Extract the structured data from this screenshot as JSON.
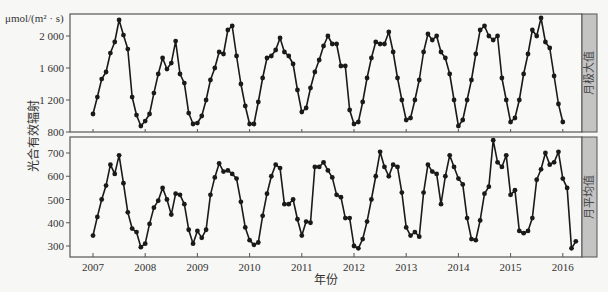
{
  "chart_data": [
    {
      "type": "line",
      "panel": "top",
      "strip_label": "月极大值",
      "unit_label": "μmol/(m² · s)",
      "ylabel": "光合有效辐射",
      "xlabel": "年份",
      "x_start": "2007-01",
      "x_step": "month",
      "x_ticks": [
        "2007",
        "2008",
        "2009",
        "2010",
        "2011",
        "2012",
        "2013",
        "2014",
        "2015",
        "2016"
      ],
      "y_ticks": [
        800,
        1200,
        1600,
        2000
      ],
      "y_tick_labels": [
        "800",
        "1 200",
        "1 600",
        "2 000"
      ],
      "ylim": [
        780,
        2250
      ],
      "values": [
        1025,
        1237,
        1462,
        1550,
        1787,
        1925,
        2200,
        2012,
        1837,
        1237,
        1012,
        875,
        937,
        1025,
        1287,
        1525,
        1725,
        1587,
        1662,
        1937,
        1525,
        1412,
        1037,
        900,
        912,
        1000,
        1200,
        1450,
        1600,
        1800,
        1775,
        2075,
        2125,
        1750,
        1400,
        1125,
        900,
        900,
        1175,
        1475,
        1725,
        1750,
        1825,
        1975,
        1800,
        1750,
        1650,
        1325,
        1050,
        1100,
        1350,
        1550,
        1700,
        1875,
        2000,
        1900,
        1900,
        1625,
        1625,
        1075,
        900,
        925,
        1175,
        1475,
        1725,
        1925,
        1900,
        1900,
        2050,
        1800,
        1475,
        1200,
        950,
        975,
        1200,
        1450,
        1800,
        2025,
        1950,
        2000,
        1800,
        1725,
        1525,
        1200,
        875,
        950,
        1200,
        1450,
        1775,
        2075,
        2125,
        2000,
        1950,
        2000,
        1475,
        1200,
        925,
        975,
        1200,
        1525,
        1775,
        2075,
        2000,
        2225,
        1925,
        1850,
        1500,
        1150,
        925
      ]
    },
    {
      "type": "line",
      "panel": "bottom",
      "strip_label": "月平均值",
      "ylabel": "光合有效辐射",
      "xlabel": "年份",
      "x_start": "2007-01",
      "x_step": "month",
      "x_ticks": [
        "2007",
        "2008",
        "2009",
        "2010",
        "2011",
        "2012",
        "2013",
        "2014",
        "2015",
        "2016"
      ],
      "y_ticks": [
        300,
        400,
        500,
        600,
        700
      ],
      "y_tick_labels": [
        "300",
        "400",
        "500",
        "600",
        "700"
      ],
      "ylim": [
        255,
        770
      ],
      "values": [
        345,
        425,
        500,
        560,
        650,
        610,
        690,
        570,
        445,
        375,
        360,
        295,
        310,
        395,
        465,
        495,
        550,
        500,
        435,
        525,
        520,
        480,
        370,
        310,
        365,
        335,
        370,
        520,
        595,
        655,
        620,
        625,
        610,
        590,
        490,
        380,
        325,
        305,
        315,
        430,
        525,
        600,
        650,
        635,
        480,
        480,
        500,
        415,
        345,
        405,
        400,
        640,
        640,
        660,
        625,
        595,
        520,
        510,
        420,
        420,
        300,
        290,
        330,
        405,
        500,
        600,
        705,
        640,
        600,
        650,
        640,
        530,
        380,
        345,
        360,
        340,
        530,
        650,
        620,
        610,
        480,
        600,
        690,
        640,
        590,
        565,
        420,
        330,
        325,
        410,
        525,
        555,
        755,
        660,
        640,
        690,
        520,
        540,
        365,
        355,
        365,
        420,
        585,
        630,
        700,
        650,
        660,
        705,
        590,
        550,
        290,
        320
      ]
    }
  ],
  "axes": {
    "xlabel": "年份",
    "ylabel": "光合有效辐射",
    "unit_label": "μmol/(m² · s)"
  },
  "colors": {
    "line": "#1a1a1a",
    "marker": "#1a1a1a",
    "strip_fill": "#c4c4c4",
    "frame": "#555555",
    "background": "#f7f7f5"
  }
}
